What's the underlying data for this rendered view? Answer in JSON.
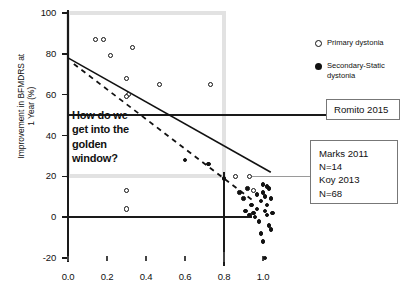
{
  "chart_data": {
    "type": "scatter",
    "title": "",
    "xlabel": "",
    "ylabel": "Improvement in BFMDRS at 1 Year (%)",
    "ylabel_lines": [
      "Improvement in BFMDRS at",
      "1 Year (%)"
    ],
    "xlim": [
      -0.08,
      1.12
    ],
    "ylim": [
      -28,
      104
    ],
    "xticks": [
      "0.0",
      "0.2",
      "0.4",
      "0.6",
      "0.8",
      "1.0"
    ],
    "xtick_values": [
      0.0,
      0.2,
      0.4,
      0.6,
      0.8,
      1.0
    ],
    "yticks": [
      "100",
      "80",
      "60",
      "40",
      "20",
      "0",
      "-20"
    ],
    "ytick_values": [
      100,
      80,
      60,
      40,
      20,
      0,
      -20
    ],
    "grid": false,
    "legend_position": "top-right",
    "series": [
      {
        "name": "Primary dystonia",
        "marker": "open-circle",
        "color": "#111111",
        "points": [
          [
            0.14,
            87
          ],
          [
            0.18,
            87
          ],
          [
            0.22,
            79
          ],
          [
            0.33,
            83
          ],
          [
            0.3,
            68
          ],
          [
            0.31,
            60
          ],
          [
            0.3,
            59
          ],
          [
            0.47,
            65
          ],
          [
            0.73,
            65
          ],
          [
            0.3,
            13
          ],
          [
            0.3,
            4
          ],
          [
            0.86,
            20
          ],
          [
            0.93,
            20
          ],
          [
            0.95,
            13
          ]
        ]
      },
      {
        "name": "Secondary-Static dystonia",
        "marker": "filled-circle",
        "color": "#111111",
        "points": [
          [
            0.6,
            28
          ],
          [
            0.72,
            26
          ],
          [
            0.8,
            19
          ],
          [
            0.88,
            12
          ],
          [
            0.9,
            9
          ],
          [
            0.92,
            14
          ],
          [
            0.94,
            6
          ],
          [
            0.95,
            2
          ],
          [
            0.96,
            0
          ],
          [
            0.97,
            4
          ],
          [
            0.98,
            -2
          ],
          [
            0.99,
            8
          ],
          [
            1.0,
            12
          ],
          [
            1.0,
            16
          ],
          [
            1.01,
            10
          ],
          [
            1.01,
            3
          ],
          [
            1.02,
            1
          ],
          [
            1.02,
            6
          ],
          [
            1.03,
            -4
          ],
          [
            1.03,
            14
          ],
          [
            1.04,
            9
          ],
          [
            1.04,
            -6
          ],
          [
            1.05,
            2
          ],
          [
            1.0,
            -12
          ],
          [
            1.01,
            -20
          ],
          [
            0.99,
            -8
          ],
          [
            0.93,
            1
          ],
          [
            0.97,
            11
          ],
          [
            1.02,
            15
          ],
          [
            0.91,
            3
          ]
        ]
      }
    ],
    "trend_lines": [
      {
        "name": "solid-trend",
        "style": "solid",
        "x0": 0.0,
        "y0": 78,
        "x1": 1.04,
        "y1": 22
      },
      {
        "name": "dashed-trend",
        "style": "dashed",
        "x0": 0.03,
        "y0": 75,
        "x1": 0.95,
        "y1": 8
      }
    ],
    "reference_lines": [
      {
        "name": "fifty-percent-line",
        "orientation": "horizontal",
        "value": 50
      },
      {
        "name": "zero-percent-line",
        "orientation": "horizontal",
        "value": 0
      },
      {
        "name": "vertical-divider",
        "orientation": "vertical",
        "value": 0.8
      }
    ],
    "shaded_region": {
      "name": "golden-window",
      "x_range": [
        0.0,
        0.8
      ],
      "y_range": [
        20,
        100
      ],
      "color": "#e2e2e2"
    },
    "annotations": [
      {
        "name": "golden-window-question",
        "text": "How do we get into the golden window?"
      },
      {
        "name": "romito-callout",
        "text": "Romito 2015"
      },
      {
        "name": "marks-koy-callout",
        "text": "Marks 2011 N=14 Koy 2013 N=68"
      }
    ]
  },
  "legend": {
    "items": [
      {
        "label": "Primary dystonia",
        "marker": "open-circle"
      },
      {
        "label": "Secondary-Static dystonia",
        "marker": "filled-circle"
      }
    ]
  },
  "callout": {
    "line1": "How do we",
    "line2": "get into the",
    "line3": "golden",
    "line4": "window?"
  },
  "annotation_boxes": {
    "romito": {
      "line1": "Romito 2015"
    },
    "marks_koy": {
      "line1": "Marks 2011",
      "line2": "N=14",
      "line3": "Koy 2013",
      "line4": "N=68"
    }
  },
  "colors": {
    "ink": "#111111",
    "golden_window": "#e2e2e2",
    "box_border": "#777777"
  }
}
